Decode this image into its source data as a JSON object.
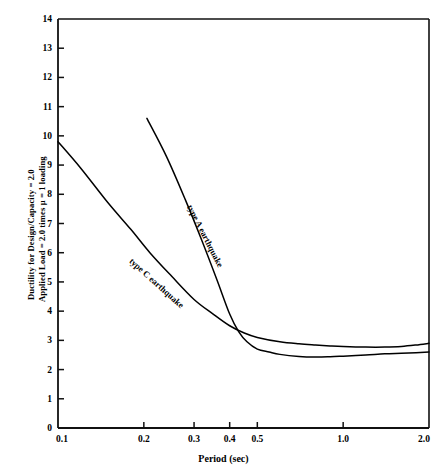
{
  "chart_data": {
    "type": "line",
    "title": "",
    "xlabel": "Period (sec)",
    "ylabel_line1": "Ductility for Design/Capacity = 2.0",
    "ylabel_line2": "Applied Load = 2.0 times μ = 1 loading",
    "xscale": "log",
    "yscale": "linear",
    "xlim": [
      0.1,
      2.0
    ],
    "ylim": [
      0,
      14
    ],
    "grid": false,
    "legend_position": "inline-annotations",
    "xticks": [
      0.1,
      0.2,
      0.3,
      0.4,
      0.5,
      1.0,
      2.0
    ],
    "xtick_labels": [
      "0.1",
      "0.2",
      "0.3",
      "0.4",
      "0.5",
      "1.0",
      "2.0"
    ],
    "yticks": [
      0,
      1,
      2,
      3,
      4,
      5,
      6,
      7,
      8,
      9,
      10,
      11,
      12,
      13,
      14
    ],
    "ytick_labels": [
      "0",
      "1",
      "2",
      "3",
      "4",
      "5",
      "6",
      "7",
      "8",
      "9",
      "10",
      "11",
      "12",
      "13",
      "14"
    ],
    "series": [
      {
        "name": "type A earthquake",
        "label": "type A earthquake",
        "color": "#000000",
        "x": [
          0.205,
          0.24,
          0.28,
          0.32,
          0.36,
          0.4,
          0.43,
          0.46,
          0.5,
          0.55,
          0.6,
          0.7,
          0.8,
          0.9,
          1.0,
          1.2,
          1.4,
          1.6,
          1.8,
          2.0
        ],
        "y": [
          10.6,
          9.3,
          7.8,
          6.4,
          5.1,
          3.9,
          3.3,
          2.95,
          2.7,
          2.6,
          2.52,
          2.45,
          2.43,
          2.44,
          2.46,
          2.5,
          2.54,
          2.56,
          2.58,
          2.6
        ]
      },
      {
        "name": "type C earthquake",
        "label": "type C earthquake",
        "color": "#000000",
        "x": [
          0.1,
          0.12,
          0.15,
          0.18,
          0.21,
          0.25,
          0.3,
          0.35,
          0.4,
          0.45,
          0.5,
          0.6,
          0.7,
          0.8,
          0.9,
          1.0,
          1.2,
          1.4,
          1.6,
          1.8,
          2.0
        ],
        "y": [
          9.8,
          8.9,
          7.7,
          6.8,
          6.0,
          5.2,
          4.4,
          3.9,
          3.5,
          3.25,
          3.1,
          2.95,
          2.88,
          2.84,
          2.81,
          2.79,
          2.77,
          2.77,
          2.79,
          2.84,
          2.9
        ]
      }
    ],
    "annotations": [
      {
        "text": "type A earthquake",
        "x": 0.3,
        "y": 7.7,
        "rotation": 63
      },
      {
        "text": "type C earthquake",
        "x": 0.185,
        "y": 5.9,
        "rotation": 42
      }
    ]
  }
}
